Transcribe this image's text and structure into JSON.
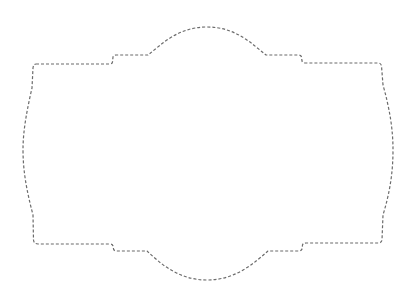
{
  "shape": {
    "kind": "decorative-label-frame",
    "stroke_color": "#6b6b6b",
    "stroke_style": "dashed",
    "fill": "none",
    "background": "#ffffff"
  }
}
